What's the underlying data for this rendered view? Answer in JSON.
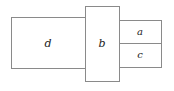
{
  "figure": {
    "type": "rectangle-packing-diagram",
    "background_color": "#ffffff",
    "stroke_color": "#8a8a8a",
    "label_color": "#1c1c1c",
    "canvas": {
      "width": 174,
      "height": 91
    }
  },
  "rectangles": [
    {
      "id": "d",
      "label": "d",
      "x": 11,
      "y": 17,
      "width": 74,
      "height": 51,
      "label_x": 48,
      "label_y": 43.5,
      "font_size": 11
    },
    {
      "id": "b",
      "label": "b",
      "x": 85,
      "y": 6,
      "width": 34,
      "height": 75,
      "label_x": 102,
      "label_y": 44,
      "font_size": 11
    },
    {
      "id": "a",
      "label": "a",
      "x": 119,
      "y": 20,
      "width": 42,
      "height": 23,
      "label_x": 140,
      "label_y": 32,
      "font_size": 10
    },
    {
      "id": "c",
      "label": "c",
      "x": 119,
      "y": 43,
      "width": 42,
      "height": 24,
      "label_x": 140,
      "label_y": 55,
      "font_size": 10
    }
  ]
}
